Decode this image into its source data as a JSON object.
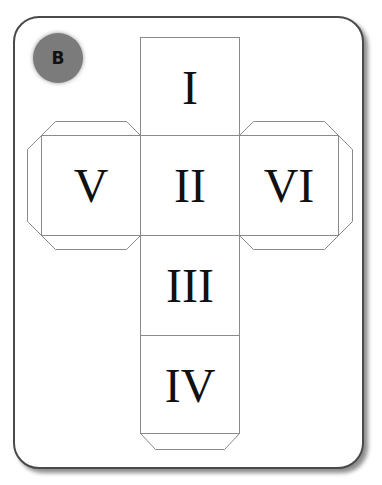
{
  "badge": {
    "label": "B",
    "color": "#7b7b7b"
  },
  "net": {
    "line_color": "#8a8a8a",
    "faces": [
      {
        "id": "top",
        "label": "I"
      },
      {
        "id": "center",
        "label": "II"
      },
      {
        "id": "below-center",
        "label": "III"
      },
      {
        "id": "bottom",
        "label": "IV"
      },
      {
        "id": "left",
        "label": "V"
      },
      {
        "id": "right",
        "label": "VI"
      }
    ]
  }
}
